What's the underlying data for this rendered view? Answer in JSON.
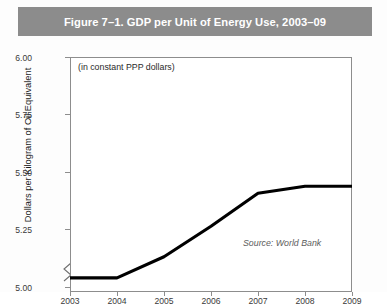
{
  "figure": {
    "title": "Figure 7–1. GDP per Unit of Energy Use, 2003–09",
    "banner_color": "#8c8c8c",
    "banner_text_color": "#ffffff",
    "background_color": "#ffffff",
    "line_color": "#000000",
    "axis_color": "#8d8d8d"
  },
  "chart_data": {
    "type": "line",
    "title": "Figure 7–1. GDP per Unit of Energy Use, 2003–09",
    "subtitle": "(in constant PPP dollars)",
    "xlabel": "",
    "ylabel": "Dollars per Kilogram of Oil Equivalent",
    "categories": [
      "2003",
      "2004",
      "2005",
      "2006",
      "2007",
      "2008",
      "2009"
    ],
    "x": [
      2003,
      2004,
      2005,
      2006,
      2007,
      2008,
      2009
    ],
    "values": [
      5.06,
      5.06,
      5.15,
      5.28,
      5.42,
      5.45,
      5.45
    ],
    "series": [
      {
        "name": "GDP per unit of energy use",
        "values": [
          5.06,
          5.06,
          5.15,
          5.28,
          5.42,
          5.45,
          5.45
        ]
      }
    ],
    "ylim": [
      5.0,
      6.0
    ],
    "xlim": [
      2003,
      2009
    ],
    "yticks": [
      "5.00",
      "5.25",
      "5.50",
      "5.75",
      "6.00"
    ],
    "ytick_values": [
      5.0,
      5.25,
      5.5,
      5.75,
      6.0
    ],
    "xticks": [
      "2003",
      "2004",
      "2005",
      "2006",
      "2007",
      "2008",
      "2009"
    ],
    "grid": false,
    "legend": false,
    "y_axis_break": true,
    "annotations": [
      {
        "text": "(in constant PPP dollars)",
        "position": "top-left-inside"
      },
      {
        "text": "Source: World Bank",
        "position": "bottom-right-inside",
        "style": "italic"
      }
    ]
  },
  "annotations": {
    "note": "(in constant PPP dollars)",
    "source": "Source: World Bank"
  },
  "axes": {
    "y_title": "Dollars per Kilogram of Oil Equivalent",
    "y_labels": [
      "6.00",
      "5.75",
      "5.50",
      "5.25",
      "5.00"
    ],
    "x_labels": [
      "2003",
      "2004",
      "2005",
      "2006",
      "2007",
      "2008",
      "2009"
    ]
  }
}
